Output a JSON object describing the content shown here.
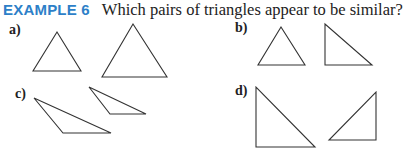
{
  "header": {
    "example_label": "EXAMPLE 6",
    "question": "Which pairs of triangles appear to be similar?",
    "accent_color": "#2d7fc8"
  },
  "parts": [
    {
      "label": "a)",
      "triangles": [
        [
          [
            57,
            32
          ],
          [
            33,
            71
          ],
          [
            81,
            71
          ]
        ],
        [
          [
            133,
            24
          ],
          [
            102,
            77
          ],
          [
            167,
            77
          ]
        ]
      ]
    },
    {
      "label": "b)",
      "triangles": [
        [
          [
            281,
            27
          ],
          [
            258,
            65
          ],
          [
            305,
            65
          ]
        ],
        [
          [
            325,
            24
          ],
          [
            325,
            65
          ],
          [
            372,
            65
          ]
        ]
      ]
    },
    {
      "label": "c)",
      "triangles": [
        [
          [
            34,
            98
          ],
          [
            63,
            133
          ],
          [
            111,
            133
          ]
        ],
        [
          [
            89,
            87
          ],
          [
            110,
            114
          ],
          [
            146,
            114
          ]
        ]
      ]
    },
    {
      "label": "d)",
      "triangles": [
        [
          [
            256,
            87
          ],
          [
            256,
            147
          ],
          [
            315,
            147
          ]
        ],
        [
          [
            376,
            92
          ],
          [
            376,
            140
          ],
          [
            329,
            140
          ]
        ]
      ]
    }
  ]
}
